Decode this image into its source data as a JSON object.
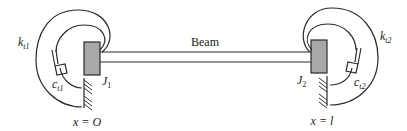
{
  "diagram": {
    "type": "mechanical-schematic",
    "beam_label": "Beam",
    "left_end": {
      "inertia_label": "J",
      "inertia_sub": "1",
      "spring_label": "k",
      "spring_sub": "t1",
      "damper_label": "c",
      "damper_sub": "t1",
      "position_label": "x = O"
    },
    "right_end": {
      "inertia_label": "J",
      "inertia_sub": "2",
      "spring_label": "k",
      "spring_sub": "t2",
      "damper_label": "c",
      "damper_sub": "t2",
      "position_label": "x = l"
    },
    "colors": {
      "line": "#2a2a2a",
      "mass_fill": "#a8a8a8",
      "background": "#ffffff"
    }
  }
}
